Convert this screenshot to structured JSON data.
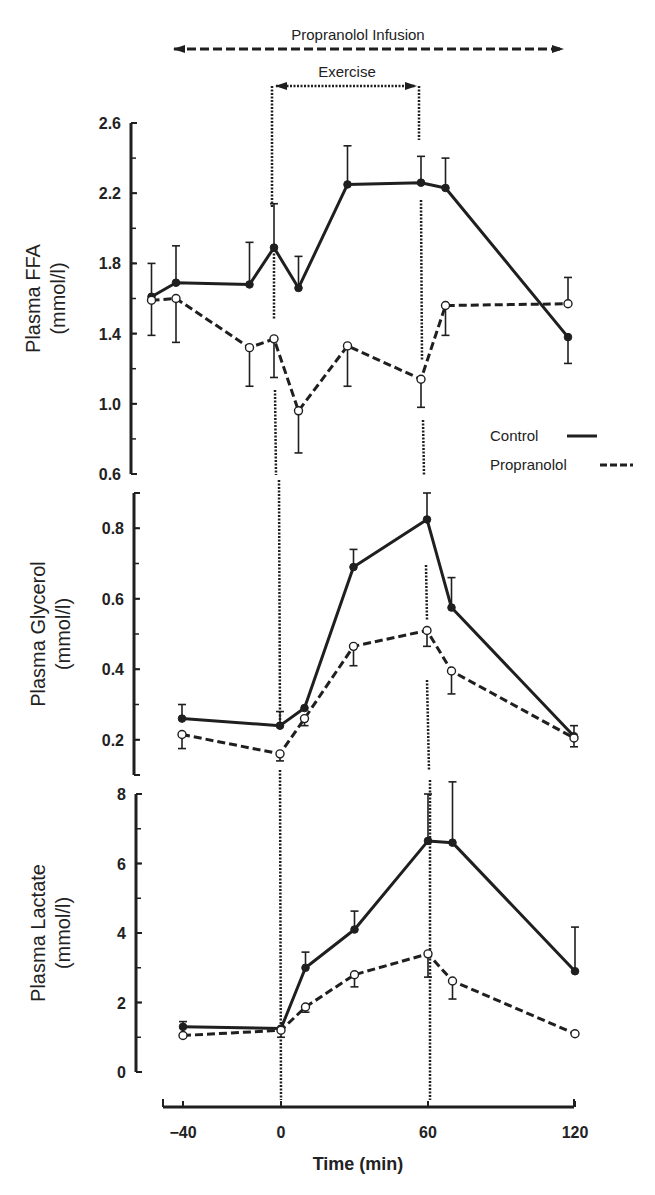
{
  "chart_data": {
    "type": "line",
    "title": "",
    "annotations": {
      "propranolol_infusion": {
        "label": "Propranolol Infusion",
        "range": [
          -50,
          120
        ]
      },
      "exercise": {
        "label": "Exercise",
        "range": [
          0,
          60
        ]
      }
    },
    "xlabel": "Time (min)",
    "x_ticks": [
      -40,
      0,
      60,
      120
    ],
    "x_tick_labels": [
      "−40",
      "0",
      "60",
      "120"
    ],
    "xlim": [
      -50,
      120
    ],
    "legend": {
      "position": "right, between FFA and Glycerol panels",
      "entries": [
        {
          "label": "Control",
          "style": "solid line, filled circles"
        },
        {
          "label": "Propranolol",
          "style": "dashed line, open circles"
        }
      ]
    },
    "panels": [
      {
        "id": "ffa",
        "ylabel": "Plasma FFA",
        "yunit": "(mmol/l)",
        "ylim": [
          0.6,
          2.6
        ],
        "y_ticks": [
          0.6,
          1.0,
          1.4,
          1.8,
          2.2,
          2.6
        ],
        "y_tick_labels": [
          "0.6",
          "1.0",
          "1.4",
          "1.8",
          "2.2",
          "2.6"
        ],
        "y_minor_step": 0.2,
        "x": [
          -50,
          -40,
          -10,
          0,
          10,
          30,
          60,
          70,
          120
        ],
        "series": [
          {
            "name": "Control",
            "values": [
              1.61,
              1.69,
              1.68,
              1.89,
              1.66,
              2.25,
              2.26,
              2.23,
              1.38
            ],
            "error_bar_ends": [
              1.8,
              1.9,
              1.92,
              2.14,
              1.84,
              2.47,
              2.41,
              2.4,
              1.23
            ]
          },
          {
            "name": "Propranolol",
            "values": [
              1.59,
              1.6,
              1.32,
              1.37,
              0.96,
              1.33,
              1.14,
              1.56,
              1.57
            ],
            "error_bar_ends": [
              1.39,
              1.35,
              1.1,
              1.15,
              0.72,
              1.1,
              0.98,
              1.39,
              1.72
            ]
          }
        ]
      },
      {
        "id": "glycerol",
        "ylabel": "Plasma Glycerol",
        "yunit": "(mmol/l)",
        "ylim": [
          0.1,
          0.9
        ],
        "y_ticks": [
          0.2,
          0.4,
          0.6,
          0.8
        ],
        "y_tick_labels": [
          "0.2",
          "0.4",
          "0.6",
          "0.8"
        ],
        "y_minor_step": 0.1,
        "x": [
          -40,
          0,
          10,
          30,
          60,
          70,
          120
        ],
        "series": [
          {
            "name": "Control",
            "values": [
              0.26,
              0.24,
              0.29,
              0.69,
              0.825,
              0.575,
              0.21
            ],
            "error_bar_ends": [
              0.3,
              0.28,
              null,
              0.74,
              0.9,
              0.66,
              0.24
            ]
          },
          {
            "name": "Propranolol",
            "values": [
              0.215,
              0.16,
              0.26,
              0.465,
              0.51,
              0.395,
              0.205
            ],
            "error_bar_ends": [
              0.175,
              0.14,
              0.24,
              0.41,
              0.465,
              0.33,
              0.18
            ]
          }
        ]
      },
      {
        "id": "lactate",
        "ylabel": "Plasma Lactate",
        "yunit": "(mmol/l)",
        "ylim": [
          0,
          8
        ],
        "y_ticks": [
          0,
          2,
          4,
          6,
          8
        ],
        "y_tick_labels": [
          "0",
          "2",
          "4",
          "6",
          "8"
        ],
        "y_minor_step": 1,
        "x": [
          -40,
          0,
          10,
          30,
          60,
          70,
          120
        ],
        "series": [
          {
            "name": "Control",
            "values": [
              1.3,
              1.25,
              3.0,
              4.1,
              6.65,
              6.6,
              2.9
            ],
            "error_bar_ends": [
              1.45,
              null,
              3.45,
              4.63,
              8.0,
              8.35,
              4.17
            ]
          },
          {
            "name": "Propranolol",
            "values": [
              1.05,
              1.2,
              1.87,
              2.8,
              3.4,
              2.62,
              1.1
            ],
            "error_bar_ends": [
              null,
              1.0,
              1.72,
              2.45,
              2.73,
              2.1,
              null
            ]
          }
        ]
      }
    ]
  },
  "colors": {
    "ink": "#1f1f1f",
    "background": "#ffffff"
  }
}
